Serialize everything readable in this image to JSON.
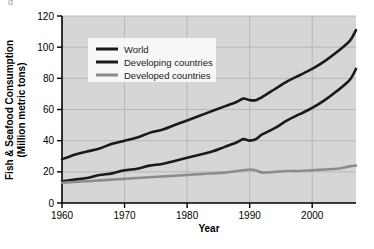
{
  "figure": {
    "background_color": "#ffffff",
    "plot_background_color": "#d6d6d6",
    "grid_color": "#b0b0b0",
    "axis_color": "#000000",
    "crop_fragment_text": "g"
  },
  "chart_data": {
    "type": "line",
    "title": "",
    "xlabel": "Year",
    "ylabel": "Fish & Seafood Consumption (Million metric tons)",
    "ylabel_line1": "Fish & Seafood Consumption",
    "ylabel_line2": "(Million metric tons)",
    "xlim": [
      1960,
      2007
    ],
    "ylim": [
      0,
      120
    ],
    "xticks": [
      1960,
      1970,
      1980,
      1990,
      2000
    ],
    "yticks": [
      0,
      20,
      40,
      60,
      80,
      100,
      120
    ],
    "grid": true,
    "legend_position": "upper-left-inside",
    "x": [
      1960,
      1962,
      1964,
      1966,
      1968,
      1970,
      1972,
      1974,
      1976,
      1978,
      1980,
      1982,
      1984,
      1986,
      1988,
      1989,
      1990,
      1991,
      1992,
      1994,
      1996,
      1998,
      2000,
      2002,
      2004,
      2006,
      2007
    ],
    "series": [
      {
        "name": "World",
        "color": "#1a1a1a",
        "width": 2.6,
        "values": [
          28,
          31,
          33,
          35,
          38,
          40,
          42,
          45,
          47,
          50,
          53,
          56,
          59,
          62,
          65,
          67,
          66,
          66,
          68,
          73,
          78,
          82,
          86,
          91,
          97,
          104,
          111
        ]
      },
      {
        "name": "Developing countries",
        "color": "#1a1a1a",
        "width": 2.6,
        "values": [
          14,
          15,
          16,
          18,
          19,
          21,
          22,
          24,
          25,
          27,
          29,
          31,
          33,
          36,
          39,
          41,
          40,
          41,
          44,
          48,
          53,
          57,
          61,
          66,
          72,
          79,
          86
        ]
      },
      {
        "name": "Developed countries",
        "color": "#8c8c8c",
        "width": 2.6,
        "values": [
          13,
          13.5,
          14,
          14.5,
          15,
          15.5,
          16,
          16.5,
          17,
          17.5,
          18,
          18.5,
          19,
          19.5,
          20.5,
          21,
          21.5,
          21,
          19.5,
          20,
          20.5,
          20.5,
          21,
          21.5,
          22,
          23.5,
          24
        ]
      }
    ]
  },
  "legend": {
    "entries": [
      {
        "label": "World",
        "color": "#1a1a1a"
      },
      {
        "label": "Developing countries",
        "color": "#1a1a1a"
      },
      {
        "label": "Developed countries",
        "color": "#8c8c8c"
      }
    ],
    "background_color": "#f7f7f7"
  }
}
